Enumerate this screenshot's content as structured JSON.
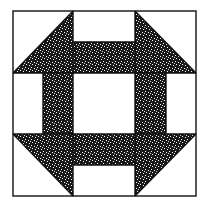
{
  "image": {
    "subject": "Churn Dash quilt block",
    "background_color": "#ffffff",
    "line_color": "#111111",
    "fill_color": "#1a1a1a",
    "speckle_color": "#ffffff"
  },
  "block": {
    "x0": 13,
    "y0": 11,
    "x1": 196,
    "y1": 196,
    "grid_x": [
      13,
      43,
      73,
      135,
      166,
      196
    ],
    "grid_y": [
      11,
      42,
      73,
      134,
      165,
      196
    ]
  }
}
